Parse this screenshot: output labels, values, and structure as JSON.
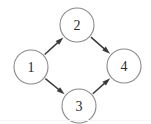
{
  "diagram": {
    "type": "directed-graph",
    "title": "",
    "background_color": "#ffffff",
    "node_fill_color": "#ffffff",
    "node_stroke_color": "#8a8a8a",
    "edge_color": "#3a3a3a",
    "label_color": "#2b2b2b",
    "node_radius": 17,
    "canvas": {
      "width": 151,
      "height": 124
    },
    "nodes": [
      {
        "id": "1",
        "label": "1",
        "cx": 31,
        "cy": 67
      },
      {
        "id": "2",
        "label": "2",
        "cx": 77,
        "cy": 25
      },
      {
        "id": "3",
        "label": "3",
        "cx": 79,
        "cy": 106
      },
      {
        "id": "4",
        "label": "4",
        "cx": 124,
        "cy": 66
      }
    ],
    "edges": [
      {
        "from": "1",
        "to": "2",
        "directed": true
      },
      {
        "from": "1",
        "to": "3",
        "directed": true
      },
      {
        "from": "2",
        "to": "4",
        "directed": true
      },
      {
        "from": "3",
        "to": "4",
        "directed": true
      }
    ]
  }
}
